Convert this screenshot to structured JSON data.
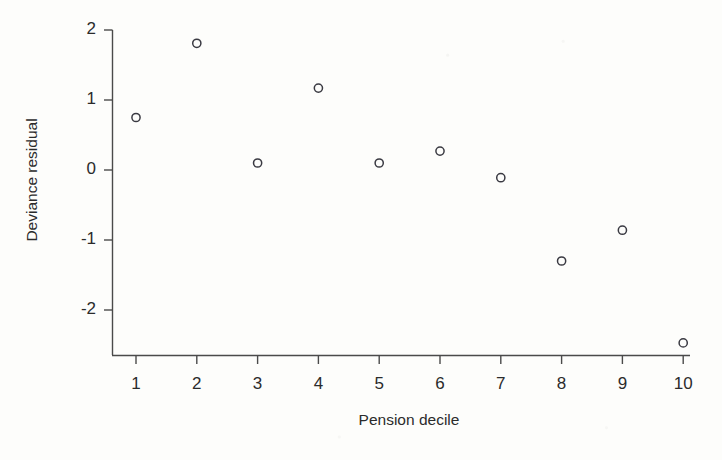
{
  "chart_data": {
    "type": "scatter",
    "title": "",
    "xlabel": "Pension decile",
    "ylabel": "Deviance residual",
    "x": [
      1,
      2,
      3,
      4,
      5,
      6,
      7,
      8,
      9,
      10
    ],
    "values": [
      0.75,
      1.81,
      0.1,
      1.17,
      0.1,
      0.27,
      -0.11,
      -1.3,
      -0.86,
      -2.47
    ],
    "series": [
      {
        "name": "Deviance residual",
        "values": [
          0.75,
          1.81,
          0.1,
          1.17,
          0.1,
          0.27,
          -0.11,
          -1.3,
          -0.86,
          -2.47
        ]
      }
    ],
    "xticks": [
      "1",
      "2",
      "3",
      "4",
      "5",
      "6",
      "7",
      "8",
      "9",
      "10"
    ],
    "xtick_values": [
      1,
      2,
      3,
      4,
      5,
      6,
      7,
      8,
      9,
      10
    ],
    "yticks": [
      "2",
      "1",
      "0",
      "-1",
      "-2"
    ],
    "ytick_values": [
      2,
      1,
      0,
      -1,
      -2
    ],
    "xlim": [
      0.6,
      10.4
    ],
    "ylim": [
      -2.64,
      2.0
    ],
    "grid": false,
    "legend": null,
    "marker": "open-circle",
    "marker_color": "#3a3a42",
    "axis_color": "#4a4a4a",
    "background_color": "#fdfdfb"
  },
  "axes": {
    "x_title": "Pension decile",
    "y_title": "Deviance residual"
  }
}
